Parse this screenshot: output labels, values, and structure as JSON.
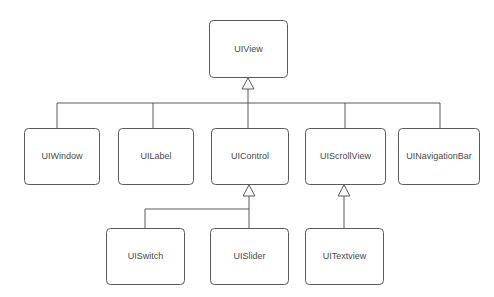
{
  "diagram": {
    "type": "uml-class-hierarchy",
    "background_color": "#ffffff",
    "line_color": "#5a5a5a",
    "box_fill_color": "#ffffff",
    "text_color": "#4a4a4a",
    "arrow_style": "hollow-triangle-inheritance",
    "nodes": [
      {
        "id": "uiview",
        "label": "UIView",
        "x": 209,
        "y": 20,
        "w": 78,
        "h": 57,
        "level": 0
      },
      {
        "id": "uiwindow",
        "label": "UIWindow",
        "x": 24,
        "y": 128,
        "w": 75,
        "h": 56,
        "level": 1
      },
      {
        "id": "uilabel",
        "label": "UILabel",
        "x": 118,
        "y": 128,
        "w": 75,
        "h": 56,
        "level": 1
      },
      {
        "id": "uicontrol",
        "label": "UIControl",
        "x": 211,
        "y": 128,
        "w": 77,
        "h": 56,
        "level": 1
      },
      {
        "id": "uiscrollview",
        "label": "UIScrollView",
        "x": 305,
        "y": 128,
        "w": 80,
        "h": 56,
        "level": 1
      },
      {
        "id": "uinavigationbar",
        "label": "UINavigationBar",
        "x": 398,
        "y": 128,
        "w": 81,
        "h": 56,
        "level": 1
      },
      {
        "id": "uiswitch",
        "label": "UISwitch",
        "x": 106,
        "y": 228,
        "w": 78,
        "h": 56,
        "level": 2
      },
      {
        "id": "uislider",
        "label": "UISlider",
        "x": 210,
        "y": 228,
        "w": 78,
        "h": 56,
        "level": 2
      },
      {
        "id": "uitextview",
        "label": "UITextview",
        "x": 305,
        "y": 228,
        "w": 78,
        "h": 56,
        "level": 2
      }
    ],
    "edges": [
      {
        "from": "uiview",
        "to": "uiwindow",
        "relation": "inheritance"
      },
      {
        "from": "uiview",
        "to": "uilabel",
        "relation": "inheritance"
      },
      {
        "from": "uiview",
        "to": "uicontrol",
        "relation": "inheritance"
      },
      {
        "from": "uiview",
        "to": "uiscrollview",
        "relation": "inheritance"
      },
      {
        "from": "uiview",
        "to": "uinavigationbar",
        "relation": "inheritance"
      },
      {
        "from": "uicontrol",
        "to": "uiswitch",
        "relation": "inheritance"
      },
      {
        "from": "uicontrol",
        "to": "uislider",
        "relation": "inheritance"
      },
      {
        "from": "uiscrollview",
        "to": "uitextview",
        "relation": "inheritance"
      }
    ]
  }
}
